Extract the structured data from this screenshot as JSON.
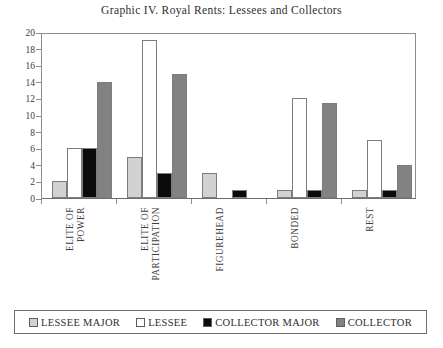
{
  "chart_data": {
    "type": "bar",
    "title": "Graphic IV. Royal Rents: Lessees and Collectors",
    "xlabel": "",
    "ylabel": "",
    "ylim": [
      0,
      20
    ],
    "yticks": [
      0,
      2,
      4,
      6,
      8,
      10,
      12,
      14,
      16,
      18,
      20
    ],
    "grid": false,
    "legend_position": "bottom",
    "categories": [
      "ELITE OF POWER",
      "ELITE OF PARTICIPATION",
      "FIGUREHEAD",
      "BONDED",
      "REST"
    ],
    "category_lines": [
      [
        "ELITE OF",
        "POWER"
      ],
      [
        "ELITE OF",
        "PARTICIPATION"
      ],
      [
        "FIGUREHEAD"
      ],
      [
        "BONDED"
      ],
      [
        "REST"
      ]
    ],
    "series": [
      {
        "name": "LESSEE MAJOR",
        "color": "#d2d2d2",
        "values": [
          2,
          5,
          3,
          1,
          1
        ]
      },
      {
        "name": "LESSEE",
        "color": "#ffffff",
        "values": [
          6,
          19,
          0,
          12,
          7
        ]
      },
      {
        "name": "COLLECTOR MAJOR",
        "color": "#0b0b0b",
        "values": [
          6,
          3,
          1,
          1,
          1
        ]
      },
      {
        "name": "COLLECTOR",
        "color": "#828282",
        "values": [
          14,
          15,
          0,
          11.5,
          4
        ]
      }
    ]
  },
  "legend": {
    "items": [
      {
        "label": "LESSEE MAJOR",
        "color": "#d2d2d2"
      },
      {
        "label": "LESSEE",
        "color": "#ffffff"
      },
      {
        "label": "COLLECTOR MAJOR",
        "color": "#0b0b0b"
      },
      {
        "label": "COLLECTOR",
        "color": "#828282"
      }
    ]
  }
}
